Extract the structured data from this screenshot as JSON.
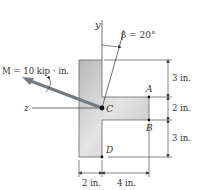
{
  "figure": {
    "moment_label": "M = 10 kip · in.",
    "angle_label": "β = 20°",
    "axis_y": "y",
    "axis_z": "z",
    "points": {
      "A": "A",
      "B": "B",
      "C": "C",
      "D": "D"
    },
    "dimensions": {
      "right_top": "3 in.",
      "right_mid": "2 in.",
      "right_bottom": "3 in.",
      "bottom_left": "2 in.",
      "bottom_right": "4 in."
    },
    "colors": {
      "section_fill": "#cfcfcf",
      "arrow": "#6f7b85",
      "lines": "#333333"
    }
  }
}
